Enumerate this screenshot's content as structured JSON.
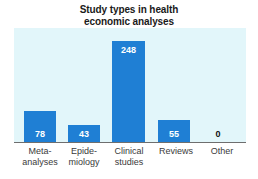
{
  "chart_data": {
    "type": "bar",
    "title": "Study types in health economic analyses",
    "title_lines": [
      "Study types in health",
      "economic analyses"
    ],
    "categories": [
      "Meta-analyses",
      "Epidemiology",
      "Clinical studies",
      "Reviews",
      "Other"
    ],
    "category_label_lines": [
      [
        "Meta-",
        "analyses"
      ],
      [
        "Epide-",
        "miology"
      ],
      [
        "Clinical",
        "studies"
      ],
      [
        "Reviews"
      ],
      [
        "Other"
      ]
    ],
    "values": [
      78,
      43,
      248,
      55,
      0
    ],
    "value_labels": [
      "78",
      "43",
      "248",
      "55",
      "0"
    ],
    "xlabel": "",
    "ylabel": "",
    "ylim": [
      0,
      280
    ],
    "grid": false,
    "legend": false,
    "bar_color": "#1f7fd4",
    "plot_background": "#e2f6fa",
    "value_label_color_inside": "#ffffff",
    "value_label_color_outside": "#111111",
    "axis_color": "#6e6e6e",
    "title_color": "#1a1a1a",
    "tick_label_color": "#3a3a3a"
  }
}
